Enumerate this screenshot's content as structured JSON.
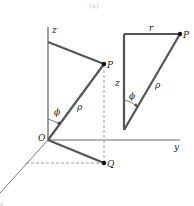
{
  "figure": {
    "caption": "(a)",
    "colors": {
      "thick_line": "#555555",
      "axis_line": "#666666",
      "dashed_line": "#888888",
      "point": "#111111",
      "text": "#222222"
    },
    "left_diagram": {
      "axis_labels": {
        "z": "z",
        "y": "y",
        "x": "x"
      },
      "points": {
        "P": "P",
        "Q": "Q",
        "O": "O"
      },
      "segment_labels": {
        "rho": "ρ"
      },
      "angle_label": "ϕ"
    },
    "right_triangle": {
      "labels": {
        "r": "r",
        "z": "z",
        "rho": "ρ",
        "P": "P",
        "phi": "ϕ"
      }
    }
  }
}
